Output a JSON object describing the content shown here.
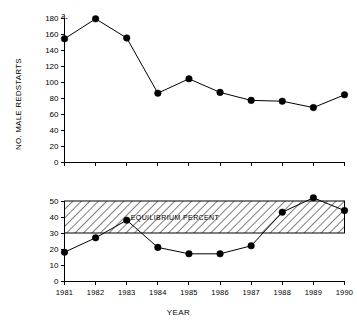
{
  "figure": {
    "xlabel": "YEAR",
    "panel_a_letter": "a.",
    "panel_b_letter": "b.",
    "panel_a_ylabel": "NO. MALE REDSTARTS",
    "panel_b_ylabel": "% YEARLING MALES",
    "band_label": "EQUILIBRIUM PERCENT",
    "ink_color": "#000000",
    "background_color": "#ffffff"
  },
  "chart_data": [
    {
      "id": "panel-a",
      "type": "line",
      "title": "a.",
      "xlabel": "YEAR",
      "ylabel": "NO. MALE REDSTARTS",
      "categories": [
        "1981",
        "1982",
        "1983",
        "1984",
        "1985",
        "1986",
        "1987",
        "1988",
        "1989",
        "1990"
      ],
      "x": [
        1981,
        1982,
        1983,
        1984,
        1985,
        1986,
        1987,
        1988,
        1989,
        1990
      ],
      "values": [
        154,
        179,
        155,
        86,
        104,
        87,
        77,
        76,
        68,
        84
      ],
      "ylim": [
        0,
        180
      ],
      "yticks": [
        0,
        20,
        40,
        60,
        80,
        100,
        120,
        140,
        160,
        180
      ],
      "xlim": [
        1981,
        1990
      ],
      "grid": false,
      "legend": "none",
      "marker": "filled-circle"
    },
    {
      "id": "panel-b",
      "type": "line",
      "title": "b.",
      "xlabel": "YEAR",
      "ylabel": "% YEARLING MALES",
      "categories": [
        "1981",
        "1982",
        "1983",
        "1984",
        "1985",
        "1986",
        "1987",
        "1988",
        "1989",
        "1990"
      ],
      "x": [
        1981,
        1982,
        1983,
        1984,
        1985,
        1986,
        1987,
        1988,
        1989,
        1990
      ],
      "values": [
        18,
        27,
        38,
        21,
        17,
        17,
        22,
        43,
        52,
        44
      ],
      "ylim": [
        0,
        50
      ],
      "yticks": [
        0,
        10,
        20,
        30,
        40,
        50
      ],
      "xlim": [
        1981,
        1990
      ],
      "grid": false,
      "legend": "none",
      "marker": "filled-circle",
      "annotations": [
        {
          "type": "hatched-band",
          "label": "EQUILIBRIUM PERCENT",
          "y_min": 30,
          "y_max": 50
        }
      ]
    }
  ],
  "axis_a": {
    "ticks": [
      {
        "label": "180",
        "value": 180
      },
      {
        "label": "160",
        "value": 160
      },
      {
        "label": "140",
        "value": 140
      },
      {
        "label": "120",
        "value": 120
      },
      {
        "label": "100",
        "value": 100
      },
      {
        "label": "80",
        "value": 80
      },
      {
        "label": "60",
        "value": 60
      },
      {
        "label": "40",
        "value": 40
      },
      {
        "label": "20",
        "value": 20
      },
      {
        "label": "0",
        "value": 0
      }
    ]
  },
  "axis_b": {
    "ticks": [
      {
        "label": "50",
        "value": 50
      },
      {
        "label": "40",
        "value": 40
      },
      {
        "label": "30",
        "value": 30
      },
      {
        "label": "20",
        "value": 20
      },
      {
        "label": "10",
        "value": 10
      },
      {
        "label": "0",
        "value": 0
      }
    ]
  },
  "axis_x": {
    "ticks": [
      {
        "label": "1981"
      },
      {
        "label": "1982"
      },
      {
        "label": "1983"
      },
      {
        "label": "1984"
      },
      {
        "label": "1985"
      },
      {
        "label": "1986"
      },
      {
        "label": "1987"
      },
      {
        "label": "1988"
      },
      {
        "label": "1989"
      },
      {
        "label": "1990"
      }
    ]
  }
}
